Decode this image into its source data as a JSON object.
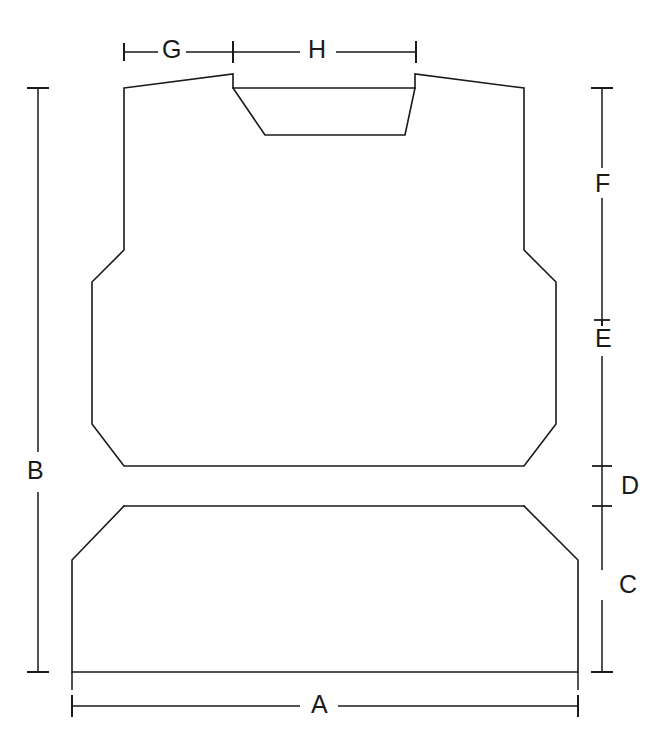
{
  "drawing": {
    "title": "Vest / body armor panel dimension drawing",
    "type": "technical-line-drawing",
    "canvas": {
      "width": 672,
      "height": 754
    },
    "stroke_color": "#1a1a1a",
    "background_color": "#ffffff",
    "stroke_width": 1.6
  },
  "dimensions": [
    {
      "key": "A",
      "label": "A",
      "orientation": "horizontal",
      "position": "bottom",
      "label_x": 318,
      "label_y": 694,
      "line": {
        "y": 706,
        "x1": 72,
        "x2": 578
      },
      "measures": "overall hem width"
    },
    {
      "key": "B",
      "label": "B",
      "orientation": "vertical",
      "position": "left",
      "label_x": 28,
      "label_y": 470,
      "line": {
        "x": 38,
        "y1": 88,
        "y2": 672
      },
      "measures": "overall garment height"
    },
    {
      "key": "C",
      "label": "C",
      "orientation": "vertical",
      "position": "right",
      "label_x": 625,
      "label_y": 584,
      "line": {
        "x": 602,
        "y1": 506,
        "y2": 672
      },
      "measures": "skirt / lower panel height"
    },
    {
      "key": "D",
      "label": "D",
      "orientation": "vertical",
      "position": "right",
      "label_x": 625,
      "label_y": 474,
      "line": {
        "x": 602,
        "y1": 466,
        "y2": 506
      },
      "measures": "waistband height"
    },
    {
      "key": "E",
      "label": "E",
      "orientation": "vertical",
      "position": "right",
      "label_x": 625,
      "label_y": 338,
      "line": {
        "x": 602,
        "y1": 320,
        "y2": 466
      },
      "measures": "torso lower section height"
    },
    {
      "key": "F",
      "label": "F",
      "orientation": "vertical",
      "position": "right",
      "label_x": 625,
      "label_y": 183,
      "line": {
        "x": 602,
        "y1": 88,
        "y2": 320
      },
      "measures": "chest / upper section height"
    },
    {
      "key": "G",
      "label": "G",
      "orientation": "horizontal",
      "position": "top",
      "label_x": 170,
      "label_y": 38,
      "line": {
        "y": 52,
        "x1": 124,
        "x2": 233
      },
      "measures": "shoulder width"
    },
    {
      "key": "H",
      "label": "H",
      "orientation": "horizontal",
      "position": "top",
      "label_x": 316,
      "label_y": 38,
      "line": {
        "y": 52,
        "x1": 233,
        "x2": 416
      },
      "measures": "neck opening width"
    }
  ],
  "outline": {
    "upper_body_path": "M 124,88 L 233,74 L 233,88 L 415,88 L 415,74 L 524,88 L 524,250 L 556,282 L 556,424 L 524,466 L 124,466 L 92,424 L 92,282 L 124,250 Z",
    "neckline_path": "M 233,88 L 265,135 L 405,135 L 415,88",
    "waistband_top_y": 466,
    "waistband_bottom_y": 506,
    "waistband_left_x": 124,
    "waistband_right_x": 524,
    "lower_body_path": "M 124,506 L 524,506 L 578,560 L 578,672 L 72,672 L 72,560 Z"
  }
}
